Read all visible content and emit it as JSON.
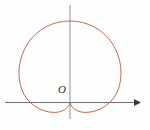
{
  "figure": {
    "background_color": "#fefefe",
    "origin_label": "O",
    "origin_label_color": "#2b2b2b"
  },
  "axes": {
    "x_axis": {
      "label": "",
      "color": "#6e6e6e",
      "stroke_width": 1.1,
      "x_start": 5,
      "x_end": 139,
      "y": 102.5,
      "arrow": "right-arrowhead"
    },
    "y_axis": {
      "label": "",
      "color": "#9a9a9a",
      "stroke_width": 1.1,
      "x": 70,
      "y_start": 5,
      "y_end": 119,
      "arrow": "none"
    }
  },
  "chart_data": {
    "type": "line",
    "title": "",
    "subtitle": "",
    "xlabel": "",
    "ylabel": "",
    "grid": false,
    "legend": null,
    "annotations": [
      {
        "text": "O",
        "x": 0,
        "y": 0,
        "note": "origin label, placed up-left of origin"
      }
    ],
    "curve_name": "cardioid",
    "curve_color": "#c4684f",
    "curve_stroke_width": 1.0,
    "polar_equation": "r = a(1 + sin(theta))",
    "cusp_point": {
      "x": 0,
      "y": 0
    },
    "pixel_geometry": {
      "origin_px": {
        "x": 70,
        "y": 102.5
      },
      "top_px": {
        "x": 70,
        "y": 21
      },
      "leftmost_px": {
        "x": 19.5,
        "y": 62
      },
      "rightmost_px": {
        "x": 120.5,
        "y": 62
      },
      "lower_left_lobe_px": {
        "x": 45,
        "y": 112
      },
      "lower_right_lobe_px": {
        "x": 96,
        "y": 112
      }
    },
    "series": [
      {
        "name": "cardioid",
        "color": "#c4684f",
        "x": [
          0.0,
          0.05,
          0.1,
          0.15,
          0.2,
          0.25,
          0.3,
          0.35,
          0.4,
          0.45,
          0.5,
          0.55,
          0.6,
          0.65,
          0.7,
          0.75,
          0.8,
          0.85,
          0.9,
          0.95,
          1.0
        ],
        "y": [
          0.0,
          0.12,
          0.26,
          0.41,
          0.56,
          0.7,
          0.83,
          0.93,
          0.99,
          1.0,
          0.97,
          0.9,
          0.79,
          0.65,
          0.49,
          0.33,
          0.17,
          0.04,
          -0.05,
          -0.08,
          0.0
        ],
        "note": "normalized trace of the upper cardioid lobe from cusp around to cusp"
      }
    ],
    "xlim": [
      -1.3,
      1.3
    ],
    "ylim": [
      -0.2,
      1.1
    ]
  }
}
